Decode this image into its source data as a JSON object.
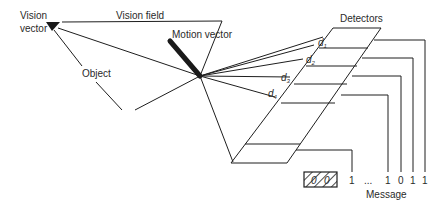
{
  "labels": {
    "vision_vector": [
      "Vision",
      "vector"
    ],
    "vision_field": "Vision field",
    "motion_vector": "Motion vector",
    "object": "Object",
    "detectors": "Detectors",
    "message": "Message"
  },
  "distances": [
    {
      "base": "d",
      "sub": "1"
    },
    {
      "base": "d",
      "sub": "2"
    },
    {
      "base": "d",
      "sub": "3"
    },
    {
      "base": "d",
      "sub": "4"
    }
  ],
  "message_bits": {
    "hatched_bits": [
      "0",
      "0"
    ],
    "bits": [
      "1",
      "...",
      "1",
      "0",
      "1",
      "1"
    ]
  }
}
